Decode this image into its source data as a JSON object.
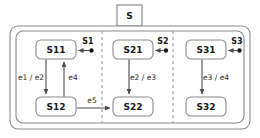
{
  "diagram": {
    "kind": "state-machine-diagram",
    "outer_state": {
      "label": "S"
    },
    "colors": {
      "background": "#ffffff",
      "stroke": "#8a8a8a",
      "state_stroke": "#8a8a8a",
      "arrow": "#4a4a4a",
      "text": "#1a1a1a",
      "divider": "#9a9a9a"
    },
    "regions": [
      {
        "name": "region-1",
        "states": [
          {
            "id": "S11",
            "label": "S11"
          },
          {
            "id": "S12",
            "label": "S12"
          }
        ],
        "entry": {
          "label": "S1",
          "target": "S11"
        },
        "transitions": [
          {
            "label": "e1 / e2",
            "from": "S11",
            "to": "S12",
            "direction": "down"
          },
          {
            "label": "e4",
            "from": "S12",
            "to": "S11",
            "direction": "up"
          }
        ]
      },
      {
        "name": "region-2",
        "states": [
          {
            "id": "S21",
            "label": "S21"
          },
          {
            "id": "S22",
            "label": "S22"
          }
        ],
        "entry": {
          "label": "S2",
          "target": "S21"
        },
        "transitions": [
          {
            "label": "e2 / e3",
            "from": "S21",
            "to": "S22",
            "direction": "down"
          }
        ]
      },
      {
        "name": "region-3",
        "states": [
          {
            "id": "S31",
            "label": "S31"
          },
          {
            "id": "S32",
            "label": "S32"
          }
        ],
        "entry": {
          "label": "S3",
          "target": "S31"
        },
        "transitions": [
          {
            "label": "e3 / e4",
            "from": "S31",
            "to": "S32",
            "direction": "down"
          }
        ]
      }
    ],
    "cross_region_transitions": [
      {
        "label": "e5",
        "from": "S12",
        "to": "S22",
        "direction": "right"
      }
    ]
  }
}
